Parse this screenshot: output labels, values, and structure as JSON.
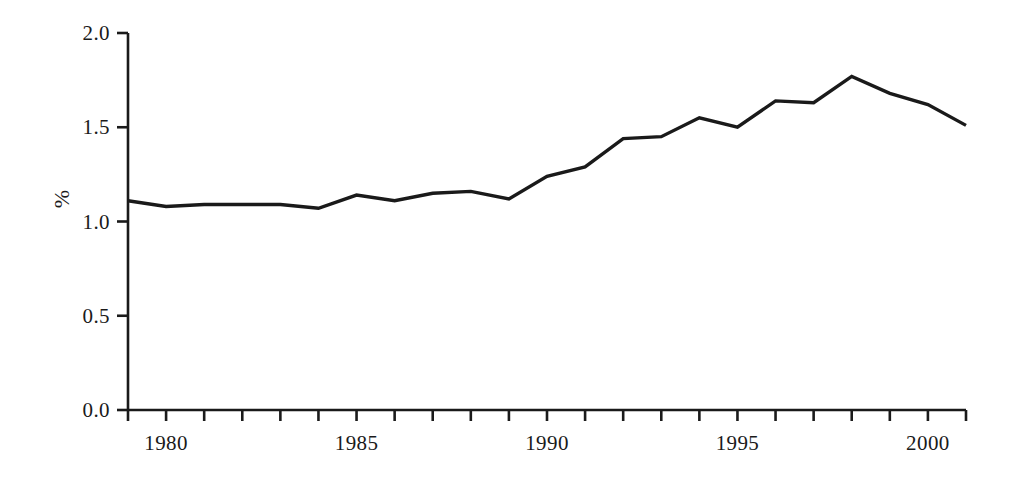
{
  "chart_data": {
    "type": "line",
    "title": "",
    "subtitle": "",
    "xlabel": "",
    "ylabel": "%",
    "xlim": [
      1979,
      2001
    ],
    "ylim": [
      0.0,
      2.0
    ],
    "grid": false,
    "legend": "none",
    "series": [
      {
        "name": "",
        "color": "#1a1a1a",
        "x": [
          1979,
          1980,
          1981,
          1982,
          1983,
          1984,
          1985,
          1986,
          1987,
          1988,
          1989,
          1990,
          1991,
          1992,
          1993,
          1994,
          1995,
          1996,
          1997,
          1998,
          1999,
          2000,
          2001
        ],
        "values": [
          1.11,
          1.08,
          1.09,
          1.09,
          1.09,
          1.07,
          1.14,
          1.11,
          1.15,
          1.16,
          1.12,
          1.24,
          1.29,
          1.44,
          1.45,
          1.55,
          1.5,
          1.64,
          1.63,
          1.77,
          1.68,
          1.62,
          1.51
        ]
      }
    ],
    "y_ticks": [
      {
        "value": 0.0,
        "label": "0.0"
      },
      {
        "value": 0.5,
        "label": "0.5"
      },
      {
        "value": 1.0,
        "label": "1.0"
      },
      {
        "value": 1.5,
        "label": "1.5"
      },
      {
        "value": 2.0,
        "label": "2.0"
      }
    ],
    "x_ticks": [
      {
        "value": 1979,
        "label": ""
      },
      {
        "value": 1980,
        "label": "1980"
      },
      {
        "value": 1981,
        "label": ""
      },
      {
        "value": 1982,
        "label": ""
      },
      {
        "value": 1983,
        "label": ""
      },
      {
        "value": 1984,
        "label": ""
      },
      {
        "value": 1985,
        "label": "1985"
      },
      {
        "value": 1986,
        "label": ""
      },
      {
        "value": 1987,
        "label": ""
      },
      {
        "value": 1988,
        "label": ""
      },
      {
        "value": 1989,
        "label": ""
      },
      {
        "value": 1990,
        "label": "1990"
      },
      {
        "value": 1991,
        "label": ""
      },
      {
        "value": 1992,
        "label": ""
      },
      {
        "value": 1993,
        "label": ""
      },
      {
        "value": 1994,
        "label": ""
      },
      {
        "value": 1995,
        "label": "1995"
      },
      {
        "value": 1996,
        "label": ""
      },
      {
        "value": 1997,
        "label": ""
      },
      {
        "value": 1998,
        "label": ""
      },
      {
        "value": 1999,
        "label": ""
      },
      {
        "value": 2000,
        "label": "2000"
      },
      {
        "value": 2001,
        "label": ""
      }
    ],
    "style": {
      "line_color": "#1a1a1a",
      "line_width": 3.4,
      "axis_color": "#1a1a1a",
      "axis_width": 2.6,
      "background": "#ffffff",
      "markers": "none"
    }
  }
}
